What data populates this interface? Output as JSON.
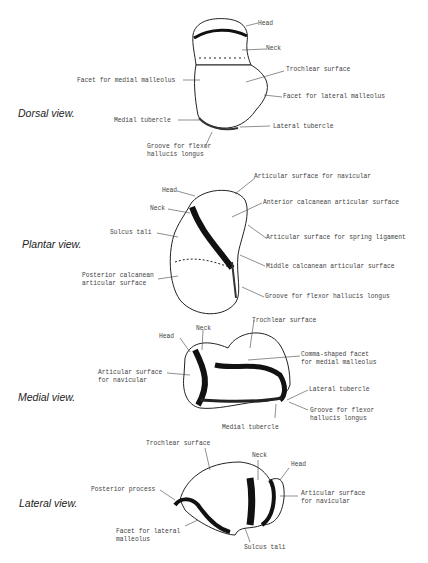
{
  "figure": {
    "views": [
      {
        "title": "Dorsal view.",
        "labels": [
          "Head",
          "Neck",
          "Trochlear surface",
          "Facet for medial malleolus",
          "Facet for lateral malleolus",
          "Medial tubercle",
          "Lateral tubercle",
          "Groove for flexor",
          "hallucis longus"
        ]
      },
      {
        "title": "Plantar view.",
        "labels": [
          "Articular surface for navicular",
          "Head",
          "Neck",
          "Anterior calcanean articular surface",
          "Sulcus tali",
          "Articular surface for spring ligament",
          "Middle calcanean articular surface",
          "Posterior calcanean",
          "articular surface",
          "Groove for flexor hallucis longus"
        ]
      },
      {
        "title": "Medial view.",
        "labels": [
          "Trochlear surface",
          "Head",
          "Neck",
          "Comma-shaped facet",
          "for medial malleolus",
          "Articular surface",
          "for navicular",
          "Lateral tubercle",
          "Groove for flexor",
          "hallucis longus",
          "Medial tubercle"
        ]
      },
      {
        "title": "Lateral view.",
        "labels": [
          "Trochlear surface",
          "Neck",
          "Head",
          "Posterior process",
          "Articular surface",
          "for navicular",
          "Facet for lateral",
          "malleolus",
          "Sulcus tali"
        ]
      }
    ]
  }
}
